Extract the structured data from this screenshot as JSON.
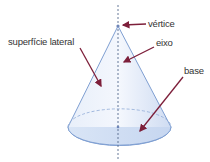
{
  "diagram": {
    "labels": {
      "vertex": "vértice",
      "axis": "eixo",
      "lateral_surface": "superfície lateral",
      "base": "base"
    },
    "colors": {
      "cone_fill": "#dfe9f8",
      "cone_edge": "#7f9fd2",
      "arrow": "#7d1f3a",
      "axis_line": "#556a8c",
      "text": "#333333"
    }
  }
}
